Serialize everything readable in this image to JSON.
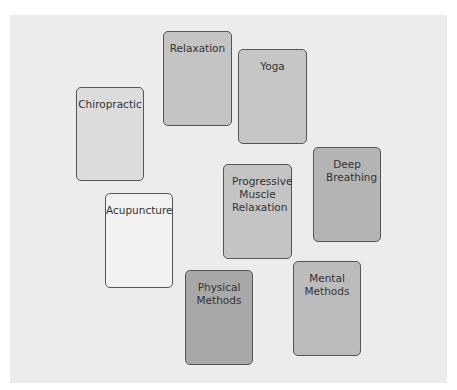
{
  "diagram": {
    "cards": [
      {
        "label": "Relaxation",
        "x": 163,
        "y": 31,
        "w": 69,
        "h": 95,
        "fill": "#c4c4c4"
      },
      {
        "label": "Yoga",
        "x": 238,
        "y": 49,
        "w": 69,
        "h": 95,
        "fill": "#c6c6c6"
      },
      {
        "label": "Chiropractic",
        "x": 76,
        "y": 87,
        "w": 68,
        "h": 94,
        "fill": "#dcdcdc"
      },
      {
        "label": "Progressive Muscle Relaxation",
        "x": 223,
        "y": 164,
        "w": 69,
        "h": 95,
        "fill": "#c4c4c4"
      },
      {
        "label": "Deep Breathing",
        "x": 313,
        "y": 147,
        "w": 68,
        "h": 95,
        "fill": "#b4b4b4"
      },
      {
        "label": "Acupuncture",
        "x": 105,
        "y": 193,
        "w": 68,
        "h": 95,
        "fill": "#f2f2f2"
      },
      {
        "label": "Physical Methods",
        "x": 185,
        "y": 270,
        "w": 68,
        "h": 95,
        "fill": "#a8a8a8"
      },
      {
        "label": "Mental Methods",
        "x": 293,
        "y": 261,
        "w": 68,
        "h": 95,
        "fill": "#bcbcbc"
      }
    ],
    "background": "#ececec"
  }
}
